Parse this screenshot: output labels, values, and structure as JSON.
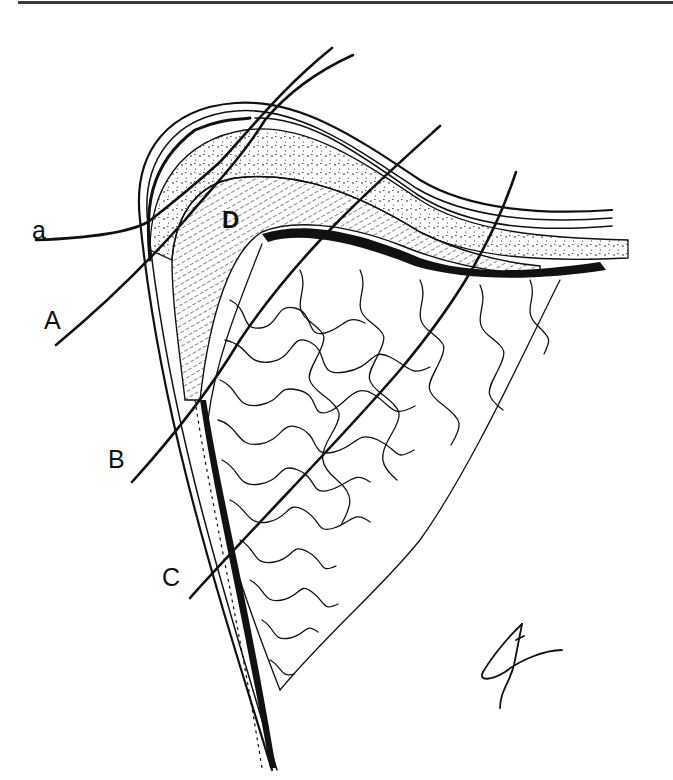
{
  "figure": {
    "type": "anatomical line illustration",
    "colors": {
      "ink": "#111111",
      "background": "#ffffff",
      "rule": "#3a3a3a"
    },
    "labels": [
      {
        "id": "a",
        "text": "a",
        "x": 32,
        "y": 218
      },
      {
        "id": "A",
        "text": "A",
        "x": 44,
        "y": 308
      },
      {
        "id": "B",
        "text": "B",
        "x": 108,
        "y": 447
      },
      {
        "id": "C",
        "text": "C",
        "x": 162,
        "y": 565
      },
      {
        "id": "D",
        "text": "D",
        "x": 222,
        "y": 208
      }
    ],
    "signature": {
      "present": true,
      "x": 480,
      "y": 620
    }
  }
}
